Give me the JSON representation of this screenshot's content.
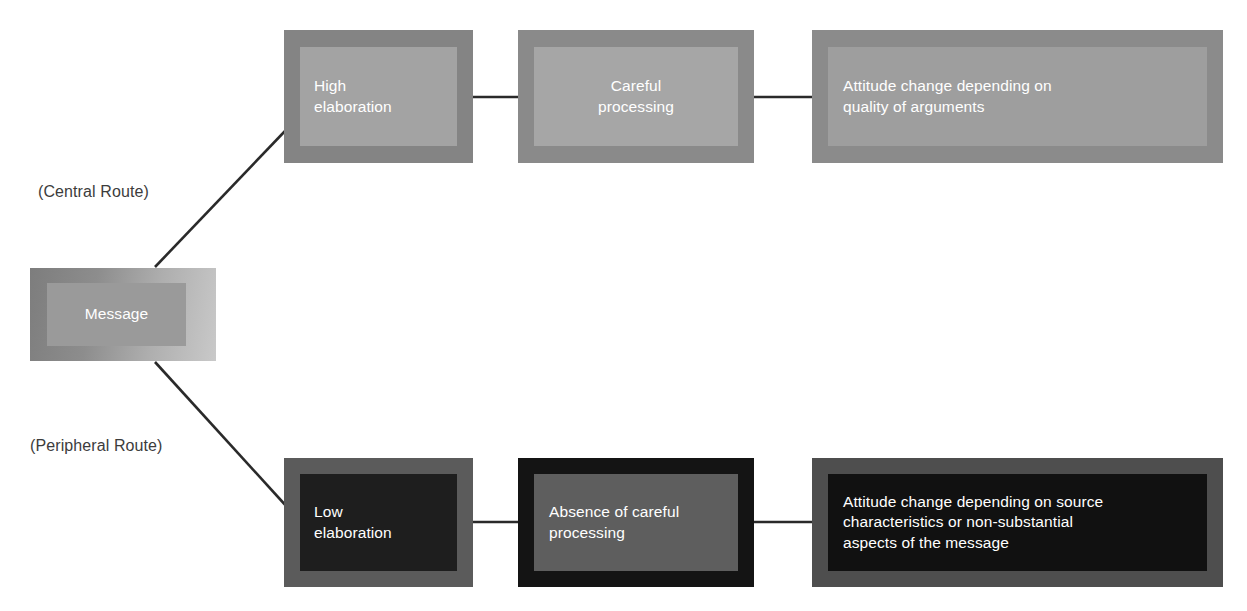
{
  "diagram": {
    "source_node": {
      "label": "Message"
    },
    "route_labels": {
      "central": "(Central Route)",
      "peripheral": "(Peripheral Route)"
    },
    "routes": [
      {
        "name": "central",
        "caption": "(Central Route)",
        "nodes": [
          {
            "id": "high",
            "label": "High\nelaboration"
          },
          {
            "id": "careful",
            "label": "Careful\nprocessing"
          },
          {
            "id": "quality",
            "label": "Attitude change depending on\nquality of arguments"
          }
        ]
      },
      {
        "name": "peripheral",
        "caption": "(Peripheral Route)",
        "nodes": [
          {
            "id": "low",
            "label": "Low\nelaboration"
          },
          {
            "id": "absence",
            "label": "Absence of careful\nprocessing"
          },
          {
            "id": "source",
            "label": "Attitude change depending on source\ncharacteristics or non-substantial\naspects of the message"
          }
        ]
      }
    ],
    "colors": {
      "connector": "#2a2a2a",
      "text": "#ffffff",
      "caption_text": "#3c3c3c",
      "background": "#ffffff",
      "central_frame": "#848484",
      "central_inner": "#a3a3a3",
      "peripheral_frame": "#141414",
      "peripheral_inner": "#5e5e5e"
    }
  }
}
